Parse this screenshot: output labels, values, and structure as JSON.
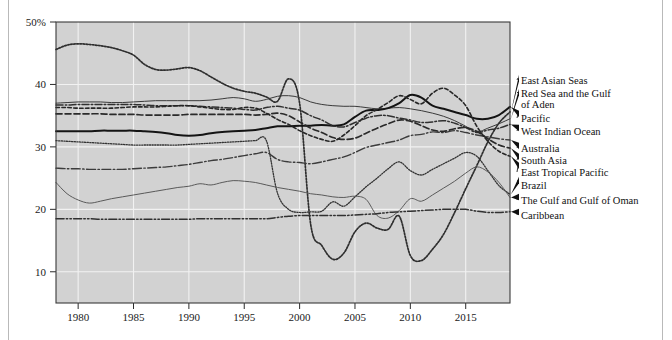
{
  "chart_data": {
    "type": "line",
    "title": "",
    "subtitle": "",
    "xlabel": "",
    "ylabel": "",
    "xlim": [
      1978,
      2019
    ],
    "ylim": [
      5,
      50
    ],
    "grid": true,
    "grid_axis": "both",
    "legend_position": "right-outside-with-leader-arrows",
    "y_ticks": [
      "50%",
      "40",
      "30",
      "20",
      "10"
    ],
    "y_tick_values": [
      50,
      40,
      30,
      20,
      10
    ],
    "x_ticks": [
      "1980",
      "1985",
      "1990",
      "1995",
      "2000",
      "2005",
      "2010",
      "2015"
    ],
    "x_tick_values": [
      1980,
      1985,
      1990,
      1995,
      2000,
      2005,
      2010,
      2015
    ],
    "x": [
      1978,
      1979,
      1980,
      1981,
      1982,
      1983,
      1984,
      1985,
      1986,
      1987,
      1988,
      1989,
      1990,
      1991,
      1992,
      1993,
      1994,
      1995,
      1996,
      1997,
      1998,
      1999,
      2000,
      2001,
      2002,
      2003,
      2004,
      2005,
      2006,
      2007,
      2008,
      2009,
      2010,
      2011,
      2012,
      2013,
      2014,
      2015,
      2016,
      2017,
      2018,
      2019
    ],
    "series": [
      {
        "name": "East Asian Seas",
        "color": "#2e2e2e",
        "style": "dotted",
        "label_line": 1,
        "values": [
          45.6,
          46.3,
          46.5,
          46.4,
          46.2,
          45.9,
          45.4,
          44.7,
          43.2,
          42.4,
          42.3,
          42.5,
          42.7,
          42.2,
          41.2,
          40.2,
          39.4,
          38.9,
          38.6,
          38.0,
          37.3,
          40.9,
          37.0,
          17.6,
          14.2,
          12.0,
          13.0,
          16.4,
          17.8,
          17.0,
          16.8,
          18.9,
          12.6,
          11.8,
          13.6,
          16.0,
          19.5,
          23.3,
          27.0,
          30.8,
          33.8,
          35.6
        ]
      },
      {
        "name": "Red Sea and the Gulf of Aden",
        "color": "#3a3a3a",
        "style": "solid-thin",
        "label_line": 2,
        "values": [
          37.0,
          37.1,
          37.2,
          37.2,
          37.2,
          37.1,
          37.1,
          37.2,
          37.3,
          37.4,
          37.4,
          37.4,
          37.4,
          37.4,
          37.5,
          37.7,
          37.9,
          37.7,
          37.3,
          37.6,
          38.1,
          38.2,
          37.9,
          37.2,
          36.8,
          36.6,
          36.5,
          36.5,
          36.3,
          36.1,
          36.2,
          36.3,
          36.1,
          35.8,
          35.4,
          34.9,
          34.2,
          33.3,
          32.4,
          33.0,
          33.7,
          34.5
        ]
      },
      {
        "name": "Pacific",
        "color": "#141414",
        "style": "solid-bold",
        "label_line": 3,
        "values": [
          32.5,
          32.5,
          32.5,
          32.5,
          32.6,
          32.6,
          32.6,
          32.6,
          32.5,
          32.4,
          32.2,
          31.9,
          31.8,
          31.9,
          32.2,
          32.4,
          32.5,
          32.6,
          32.7,
          33.0,
          33.3,
          33.3,
          33.4,
          33.4,
          33.5,
          33.4,
          33.6,
          34.8,
          35.8,
          35.9,
          36.2,
          37.0,
          38.3,
          37.9,
          36.6,
          36.1,
          35.6,
          35.1,
          34.5,
          34.5,
          35.1,
          36.4
        ]
      },
      {
        "name": "West Indian Ocean",
        "color": "#303030",
        "style": "dash-dot",
        "label_line": 4,
        "values": [
          36.7,
          36.7,
          36.8,
          36.8,
          36.8,
          36.8,
          36.8,
          36.8,
          36.7,
          36.6,
          36.6,
          36.6,
          36.6,
          36.5,
          36.4,
          36.3,
          36.2,
          36.0,
          35.9,
          36.3,
          36.5,
          36.2,
          35.9,
          35.0,
          34.3,
          33.4,
          33.2,
          33.9,
          34.6,
          35.0,
          35.0,
          34.6,
          34.3,
          33.9,
          34.0,
          34.2,
          33.8,
          33.1,
          32.3,
          32.7,
          33.0,
          33.6
        ]
      },
      {
        "name": "Australia",
        "color": "#3c3c3c",
        "style": "dash-dot-long",
        "label_line": 5,
        "values": [
          26.6,
          26.5,
          26.5,
          26.4,
          26.4,
          26.4,
          26.4,
          26.5,
          26.6,
          26.7,
          26.8,
          27.0,
          27.2,
          27.5,
          27.8,
          28.0,
          28.3,
          28.6,
          28.9,
          29.1,
          28.0,
          27.6,
          27.5,
          27.3,
          27.6,
          28.0,
          28.4,
          29.1,
          29.9,
          30.3,
          30.7,
          31.1,
          31.8,
          32.0,
          32.4,
          32.3,
          32.6,
          32.3,
          31.9,
          31.6,
          31.3,
          31.1
        ]
      },
      {
        "name": "South Asia",
        "color": "#2a2a2a",
        "style": "dashed-long",
        "label_line": 6,
        "values": [
          35.3,
          35.3,
          35.3,
          35.3,
          35.3,
          35.2,
          35.2,
          35.2,
          35.1,
          35.1,
          35.1,
          35.1,
          35.2,
          35.2,
          35.2,
          35.2,
          35.2,
          35.2,
          35.1,
          35.2,
          35.4,
          35.0,
          34.0,
          33.0,
          32.3,
          31.5,
          31.2,
          31.4,
          32.2,
          33.0,
          33.7,
          34.3,
          34.1,
          33.4,
          32.7,
          32.5,
          32.9,
          33.1,
          32.5,
          31.3,
          30.3,
          29.8
        ]
      },
      {
        "name": "East Tropical Pacific",
        "color": "#262626",
        "style": "dashed-short",
        "label_line": 7,
        "values": [
          36.3,
          36.3,
          36.2,
          36.2,
          36.2,
          36.2,
          36.3,
          36.4,
          36.4,
          36.4,
          36.5,
          36.6,
          36.6,
          36.4,
          36.2,
          36.0,
          36.0,
          36.3,
          36.2,
          35.4,
          34.4,
          33.6,
          32.6,
          31.8,
          31.2,
          30.9,
          31.9,
          33.4,
          35.0,
          36.0,
          37.1,
          38.2,
          37.6,
          36.9,
          38.6,
          39.4,
          38.3,
          36.6,
          33.3,
          30.9,
          29.3,
          28.5
        ]
      },
      {
        "name": "Brazil",
        "color": "#333333",
        "style": "dotted-fine",
        "label_line": 8,
        "values": [
          31.0,
          30.9,
          30.8,
          30.7,
          30.6,
          30.5,
          30.4,
          30.3,
          30.3,
          30.3,
          30.3,
          30.3,
          30.4,
          30.5,
          30.6,
          30.7,
          30.8,
          30.9,
          31.0,
          31.0,
          22.6,
          20.0,
          19.5,
          19.6,
          19.7,
          21.2,
          20.5,
          22.0,
          23.6,
          25.0,
          26.5,
          27.6,
          26.2,
          25.5,
          26.4,
          27.3,
          28.2,
          29.1,
          28.5,
          26.2,
          23.8,
          22.4
        ]
      },
      {
        "name": "The Gulf and Gulf of Oman",
        "color": "#5a5a5a",
        "style": "solid-light",
        "label_line": 9,
        "values": [
          24.3,
          22.5,
          21.5,
          21.0,
          21.3,
          21.7,
          22.0,
          22.3,
          22.6,
          22.9,
          23.2,
          23.5,
          23.7,
          24.1,
          23.9,
          24.3,
          24.6,
          24.5,
          24.3,
          23.9,
          23.5,
          23.2,
          22.9,
          22.5,
          22.3,
          22.0,
          21.9,
          22.1,
          21.6,
          19.0,
          18.6,
          19.8,
          21.7,
          21.3,
          22.3,
          23.4,
          24.5,
          25.8,
          26.8,
          26.0,
          24.3,
          21.9
        ]
      },
      {
        "name": "Caribbean",
        "color": "#313131",
        "style": "dash-dot-dot",
        "label_line": 10,
        "values": [
          18.5,
          18.5,
          18.5,
          18.5,
          18.4,
          18.4,
          18.4,
          18.4,
          18.4,
          18.4,
          18.4,
          18.4,
          18.4,
          18.5,
          18.5,
          18.5,
          18.5,
          18.5,
          18.5,
          18.5,
          18.7,
          18.9,
          19.0,
          19.0,
          19.0,
          19.0,
          19.0,
          19.1,
          19.2,
          19.3,
          19.5,
          19.6,
          19.7,
          19.8,
          19.9,
          20.0,
          20.0,
          20.0,
          19.7,
          19.5,
          19.5,
          19.6
        ]
      }
    ]
  },
  "legend": {
    "entries": [
      {
        "label": "East Asian Seas"
      },
      {
        "label": "Red Sea and the Gulf"
      },
      {
        "label": "of Aden"
      },
      {
        "label": "Pacific"
      },
      {
        "label": "West Indian Ocean"
      },
      {
        "label": "Australia"
      },
      {
        "label": "South Asia"
      },
      {
        "label": "East Tropical Pacific"
      },
      {
        "label": "Brazil"
      },
      {
        "label": "The Gulf and Gulf of Oman"
      },
      {
        "label": "Caribbean"
      }
    ]
  },
  "colors": {
    "plot_background": "#d2d2d2",
    "gridline": "#f2f2f2",
    "plot_border": "#3a3a3a",
    "text": "#111111",
    "page_background": "#ffffff"
  }
}
